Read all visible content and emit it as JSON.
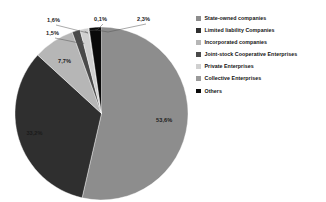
{
  "chart_data": {
    "type": "pie",
    "title": "",
    "subtitle": "",
    "xlabel": "",
    "ylabel": "",
    "grid": false,
    "legend_position": "right",
    "value_suffix": "%",
    "decimal_separator": ",",
    "categories": [
      "State-owned companies",
      "Limited liability  Companies",
      "Incorporated companies",
      "Joint-stock Cooperative Enterprises",
      "Private Enterprises",
      "Collective Enterprises",
      "Others"
    ],
    "values": [
      53.6,
      33.2,
      7.7,
      1.5,
      1.6,
      0.1,
      2.3
    ],
    "labels": [
      "53,6%",
      "33,2%",
      "7,7%",
      "1,5%",
      "1,6%",
      "0,1%",
      "2,3%"
    ],
    "colors": [
      "#8d8d8d",
      "#2f2f2f",
      "#b6b6b6",
      "#4a4a4a",
      "#d0d0d0",
      "#9a9a9a",
      "#0a0a0a"
    ],
    "slices": [
      {
        "name": "State-owned companies",
        "value": 53.6,
        "label": "53,6%",
        "color": "#8d8d8d"
      },
      {
        "name": "Limited liability  Companies",
        "value": 33.2,
        "label": "33,2%",
        "color": "#2f2f2f"
      },
      {
        "name": "Incorporated companies",
        "value": 7.7,
        "label": "7,7%",
        "color": "#b6b6b6"
      },
      {
        "name": "Joint-stock Cooperative Enterprises",
        "value": 1.5,
        "label": "1,5%",
        "color": "#4a4a4a"
      },
      {
        "name": "Private Enterprises",
        "value": 1.6,
        "label": "1,6%",
        "color": "#d0d0d0"
      },
      {
        "name": "Collective Enterprises",
        "value": 0.1,
        "label": "0,1%",
        "color": "#9a9a9a"
      },
      {
        "name": "Others",
        "value": 2.3,
        "label": "2,3%",
        "color": "#0a0a0a"
      }
    ]
  },
  "legend": {
    "items": [
      {
        "label": "State-owned companies",
        "color": "#8d8d8d"
      },
      {
        "label": "Limited liability  Companies",
        "color": "#2f2f2f"
      },
      {
        "label": "Incorporated companies",
        "color": "#b6b6b6"
      },
      {
        "label": "Joint-stock Cooperative Enterprises",
        "color": "#4a4a4a"
      },
      {
        "label": "Private Enterprises",
        "color": "#d0d0d0"
      },
      {
        "label": "Collective Enterprises",
        "color": "#9a9a9a"
      },
      {
        "label": "Others",
        "color": "#0a0a0a"
      }
    ]
  }
}
